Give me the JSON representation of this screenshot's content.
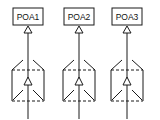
{
  "diagram": {
    "units": [
      {
        "label": "POA1",
        "cx": 28
      },
      {
        "label": "POA2",
        "cx": 79
      },
      {
        "label": "POA3",
        "cx": 127
      }
    ],
    "colors": {
      "stroke": "#1a1a1a",
      "background": "#ffffff"
    }
  }
}
